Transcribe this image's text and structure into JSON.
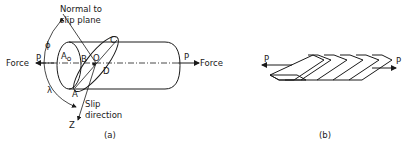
{
  "figure_a": {
    "caption": "(a)",
    "normal_label_line1": "Normal to",
    "normal_label_line2": "slip plane",
    "force_left": "Force",
    "force_right": "Force",
    "p_left": "P",
    "p_right": "P",
    "area_label": "A",
    "area_subscript": "o",
    "point_b": "B",
    "point_o": "O",
    "point_c": "C",
    "point_d": "D",
    "point_a": "A",
    "angle_phi": "ϕ",
    "angle_lambda": "λ",
    "slip_label_line1": "Slip",
    "slip_label_line2": "direction",
    "axis_z": "Z"
  },
  "figure_b": {
    "caption": "(b)",
    "p_left": "P",
    "p_right": "P",
    "slab_count": 7
  }
}
